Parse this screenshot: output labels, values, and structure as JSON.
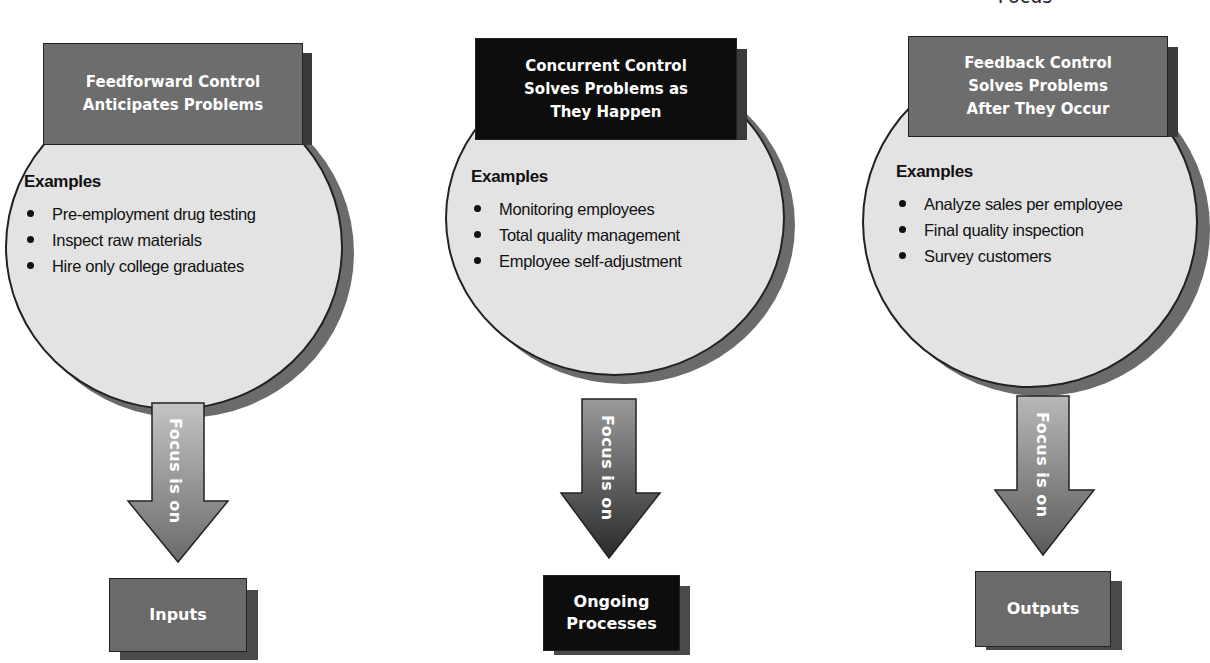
{
  "top_cut_title": "Focus",
  "panels": [
    {
      "id": "feedforward",
      "header": "Feedforward Control Anticipates Problems",
      "header_lines": [
        "Feedforward Control",
        "Anticipates Problems"
      ],
      "header_color": "#6d6d6d",
      "examples_title": "Examples",
      "examples": [
        "Pre-employment drug testing",
        "Inspect raw materials",
        "Hire only college graduates"
      ],
      "arrow_label": "Focus is on",
      "focus_box": "Inputs",
      "focus_box_lines": [
        "Inputs"
      ],
      "focus_box_color": "#6a6a6a"
    },
    {
      "id": "concurrent",
      "header": "Concurrent Control Solves Problems as They Happen",
      "header_lines": [
        "Concurrent Control",
        "Solves Problems as",
        "They Happen"
      ],
      "header_color": "#0d0d0d",
      "examples_title": "Examples",
      "examples": [
        "Monitoring employees",
        "Total quality management",
        "Employee self-adjustment"
      ],
      "arrow_label": "Focus is on",
      "focus_box": "Ongoing Processes",
      "focus_box_lines": [
        "Ongoing",
        "Processes"
      ],
      "focus_box_color": "#0d0d0d"
    },
    {
      "id": "feedback",
      "header": "Feedback Control Solves Problems After They Occur",
      "header_lines": [
        "Feedback Control",
        "Solves Problems",
        "After They Occur"
      ],
      "header_color": "#6d6d6d",
      "examples_title": "Examples",
      "examples": [
        "Analyze sales per employee",
        "Final quality inspection",
        "Survey customers"
      ],
      "arrow_label": "Focus is on",
      "focus_box": "Outputs",
      "focus_box_lines": [
        "Outputs"
      ],
      "focus_box_color": "#6a6a6a"
    }
  ],
  "colors": {
    "circle_fill": "#e3e3e3",
    "circle_shadow": "#6b6b6b",
    "gray_box": "#6d6d6d",
    "black_box": "#0d0d0d",
    "text_on_box": "#ffffff"
  }
}
